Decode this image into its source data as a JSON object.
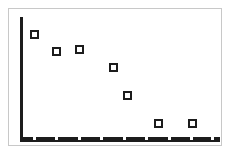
{
  "chart_data": {
    "type": "scatter",
    "title": "",
    "subtitle": "",
    "xlabel": "",
    "ylabel": "",
    "xlim": [
      0,
      9
    ],
    "ylim": [
      0,
      10
    ],
    "grid": false,
    "legend": null,
    "legend_position": "none",
    "marker_style": "open-square",
    "marker_color": "#1c1c1c",
    "marker_fill": "#ffffff",
    "axis_color": "#1c1c1c",
    "frame_color": "#c8c8c8",
    "background_color": "#ffffff",
    "x_tick_labels": [],
    "y_tick_labels": [],
    "x_tick_count": 9,
    "points": [
      {
        "x": 1.0,
        "y": 8.9,
        "px": 33,
        "py": 33
      },
      {
        "x": 2.0,
        "y": 7.5,
        "px": 55,
        "py": 50
      },
      {
        "x": 3.0,
        "y": 7.7,
        "px": 78,
        "py": 48
      },
      {
        "x": 4.5,
        "y": 6.3,
        "px": 112,
        "py": 66
      },
      {
        "x": 5.2,
        "y": 4.0,
        "px": 126,
        "py": 94
      },
      {
        "x": 6.6,
        "y": 1.6,
        "px": 157,
        "py": 122
      },
      {
        "x": 8.1,
        "y": 1.6,
        "px": 191,
        "py": 122
      }
    ],
    "x_ticks_px": [
      33,
      55,
      78,
      100,
      123,
      145,
      168,
      190,
      211
    ],
    "annotations": []
  },
  "figure": {
    "name": "scatter-plot-figure",
    "width": 232,
    "height": 155
  }
}
